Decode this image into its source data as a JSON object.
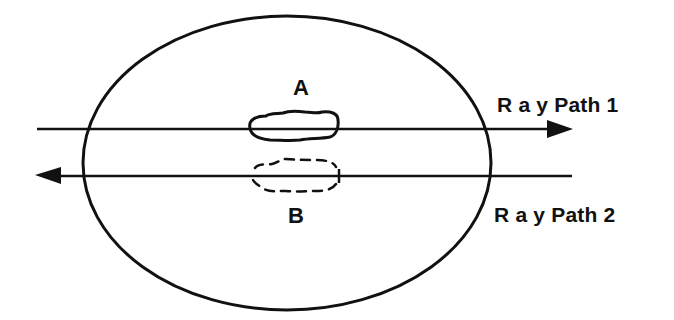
{
  "diagram": {
    "type": "ray-path-tomography-schematic",
    "stroke_color": "#111111",
    "background": "#ffffff",
    "boundary": {
      "shape": "ellipse",
      "cx": 287,
      "cy": 163,
      "rx": 204,
      "ry": 147
    },
    "anomalies": [
      {
        "id": "A",
        "label": "A",
        "style": "solid",
        "description": "solid-outlined irregular blob on ray path 1"
      },
      {
        "id": "B",
        "label": "B",
        "style": "dashed",
        "description": "dashed-outlined irregular blob on ray path 2"
      }
    ],
    "rays": [
      {
        "id": "ray1",
        "label": "R a y Path 1",
        "direction": "left-to-right",
        "y": 129,
        "x_start": 37,
        "x_end": 573
      },
      {
        "id": "ray2",
        "label": "R a y Path 2",
        "direction": "right-to-left",
        "y": 176,
        "x_start": 572,
        "x_end": 35
      }
    ]
  }
}
